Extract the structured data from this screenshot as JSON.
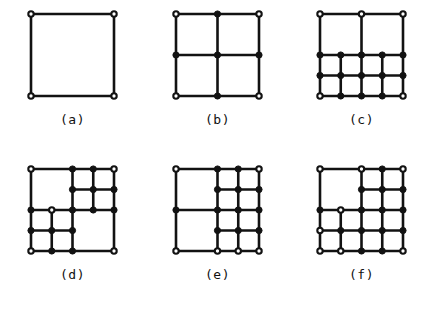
{
  "figure": {
    "title": "",
    "background_color": "#ffffff",
    "line_color": "#121212",
    "node_filled_color": "#121212",
    "node_open_fill": "#ffffff",
    "width": 434,
    "height": 310,
    "columns": 3,
    "rows": 2
  },
  "chart_data": {
    "type": "diagram",
    "node_legend": {
      "open": "coarse / parent grid node",
      "filled": "refined / hanging node"
    },
    "domain": {
      "x0": 0,
      "x1": 1,
      "y0": 0,
      "y1": 1
    },
    "panels": [
      {
        "label": "(a)",
        "index": 0,
        "divisions": 1,
        "cells": 1,
        "node_counts": {
          "open": 4,
          "filled": 0,
          "total": 4
        },
        "segments": [
          [
            0,
            0,
            1,
            0
          ],
          [
            0,
            1,
            1,
            1
          ],
          [
            0,
            0,
            0,
            1
          ],
          [
            1,
            0,
            1,
            1
          ]
        ],
        "nodes_open": [
          [
            0,
            0
          ],
          [
            1,
            0
          ],
          [
            0,
            1
          ],
          [
            1,
            1
          ]
        ],
        "nodes_filled": []
      },
      {
        "label": "(b)",
        "index": 1,
        "divisions": 2,
        "cells": 4,
        "node_counts": {
          "open": 4,
          "filled": 5,
          "total": 9
        },
        "segments": [
          [
            0,
            0,
            1,
            0
          ],
          [
            0,
            0.5,
            1,
            0.5
          ],
          [
            0,
            1,
            1,
            1
          ],
          [
            0,
            0,
            0,
            1
          ],
          [
            0.5,
            0,
            0.5,
            1
          ],
          [
            1,
            0,
            1,
            1
          ]
        ],
        "nodes_open": [
          [
            0,
            0
          ],
          [
            1,
            0
          ],
          [
            0,
            1
          ],
          [
            1,
            1
          ]
        ],
        "nodes_filled": [
          [
            0.5,
            0
          ],
          [
            0,
            0.5
          ],
          [
            0.5,
            0.5
          ],
          [
            1,
            0.5
          ],
          [
            0.5,
            1
          ]
        ]
      },
      {
        "label": "(c)",
        "index": 2,
        "cells": 10,
        "refinement": "bottom half refined to 4 columns x 2 rows; top half left coarse 2 x 1",
        "node_counts": {
          "open": 5,
          "filled": 13,
          "total": 18
        },
        "segments": [
          [
            0,
            1,
            1,
            1
          ],
          [
            0,
            0.5,
            1,
            0.5
          ],
          [
            0,
            0.25,
            1,
            0.25
          ],
          [
            0,
            0,
            1,
            0
          ],
          [
            0,
            0,
            0,
            1
          ],
          [
            0.25,
            0,
            0.25,
            0.5
          ],
          [
            0.5,
            0,
            0.5,
            1
          ],
          [
            0.75,
            0,
            0.75,
            0.5
          ],
          [
            1,
            0,
            1,
            1
          ]
        ],
        "nodes_open": [
          [
            0,
            1
          ],
          [
            0.5,
            1
          ],
          [
            1,
            1
          ],
          [
            0,
            0
          ],
          [
            1,
            0
          ]
        ],
        "nodes_filled": [
          [
            0,
            0.5
          ],
          [
            0.25,
            0.5
          ],
          [
            0.5,
            0.5
          ],
          [
            0.75,
            0.5
          ],
          [
            1,
            0.5
          ],
          [
            0,
            0.25
          ],
          [
            0.25,
            0.25
          ],
          [
            0.5,
            0.25
          ],
          [
            0.75,
            0.25
          ],
          [
            1,
            0.25
          ],
          [
            0.25,
            0
          ],
          [
            0.5,
            0
          ],
          [
            0.75,
            0
          ]
        ]
      },
      {
        "label": "(d)",
        "index": 3,
        "cells": 10,
        "refinement": "top-right and bottom-left quadrants refined to 2 x 2; other two quadrants coarse",
        "node_counts": {
          "open": 5,
          "filled": 13,
          "total": 18
        },
        "segments": [
          [
            0,
            1,
            1,
            1
          ],
          [
            0,
            0.5,
            1,
            0.5
          ],
          [
            0.5,
            0.75,
            1,
            0.75
          ],
          [
            0,
            0.25,
            0.5,
            0.25
          ],
          [
            0,
            0,
            1,
            0
          ],
          [
            0,
            0,
            0,
            1
          ],
          [
            0.25,
            0,
            0.25,
            0.5
          ],
          [
            0.5,
            0,
            0.5,
            1
          ],
          [
            0.75,
            0.5,
            0.75,
            1
          ],
          [
            1,
            0,
            1,
            1
          ]
        ],
        "nodes_open": [
          [
            0,
            1
          ],
          [
            1,
            1
          ],
          [
            0,
            0
          ],
          [
            1,
            0
          ],
          [
            0.25,
            0.5
          ]
        ],
        "nodes_filled": [
          [
            0.5,
            1
          ],
          [
            0.75,
            1
          ],
          [
            0.5,
            0.75
          ],
          [
            0.75,
            0.75
          ],
          [
            1,
            0.75
          ],
          [
            0,
            0.5
          ],
          [
            0.5,
            0.5
          ],
          [
            0.75,
            0.5
          ],
          [
            1,
            0.5
          ],
          [
            0,
            0.25
          ],
          [
            0.25,
            0.25
          ],
          [
            0.5,
            0.25
          ],
          [
            0.25,
            0
          ],
          [
            0.5,
            0
          ]
        ]
      },
      {
        "label": "(e)",
        "index": 4,
        "cells": 10,
        "refinement": "right half refined to 2 columns x 4 rows; left half coarse 1 x 2",
        "node_counts": {
          "open": 6,
          "filled": 12,
          "total": 18
        },
        "segments": [
          [
            0,
            1,
            1,
            1
          ],
          [
            0.5,
            0.75,
            1,
            0.75
          ],
          [
            0,
            0.5,
            1,
            0.5
          ],
          [
            0.5,
            0.25,
            1,
            0.25
          ],
          [
            0,
            0,
            1,
            0
          ],
          [
            0,
            0,
            0,
            1
          ],
          [
            0.5,
            0,
            0.5,
            1
          ],
          [
            0.75,
            0,
            0.75,
            1
          ],
          [
            1,
            0,
            1,
            1
          ]
        ],
        "nodes_open": [
          [
            0,
            1
          ],
          [
            1,
            1
          ],
          [
            0,
            0
          ],
          [
            0.5,
            0
          ],
          [
            0.75,
            0
          ],
          [
            1,
            0
          ]
        ],
        "nodes_filled": [
          [
            0.5,
            1
          ],
          [
            0.75,
            1
          ],
          [
            0.5,
            0.75
          ],
          [
            0.75,
            0.75
          ],
          [
            1,
            0.75
          ],
          [
            0,
            0.5
          ],
          [
            0.5,
            0.5
          ],
          [
            0.75,
            0.5
          ],
          [
            1,
            0.5
          ],
          [
            0.5,
            0.25
          ],
          [
            0.75,
            0.25
          ],
          [
            1,
            0.25
          ]
        ]
      },
      {
        "label": "(f)",
        "index": 5,
        "cells": 12,
        "refinement": "right half refined to 2 columns x 4 rows; bottom-left quadrant refined to 2 x 2; top-left quadrant coarse",
        "node_counts": {
          "open": 8,
          "filled": 13,
          "total": 21
        },
        "segments": [
          [
            0,
            1,
            1,
            1
          ],
          [
            0.5,
            0.75,
            1,
            0.75
          ],
          [
            0,
            0.5,
            1,
            0.5
          ],
          [
            0,
            0.25,
            1,
            0.25
          ],
          [
            0,
            0,
            1,
            0
          ],
          [
            0,
            0,
            0,
            1
          ],
          [
            0.25,
            0,
            0.25,
            0.5
          ],
          [
            0.5,
            0,
            0.5,
            1
          ],
          [
            0.75,
            0,
            0.75,
            1
          ],
          [
            1,
            0,
            1,
            1
          ]
        ],
        "nodes_open": [
          [
            0,
            1
          ],
          [
            1,
            1
          ],
          [
            0,
            0
          ],
          [
            0.25,
            0
          ],
          [
            0.25,
            0.5
          ],
          [
            0,
            0.25
          ],
          [
            0.5,
            1
          ],
          [
            1,
            0
          ]
        ],
        "nodes_filled": [
          [
            0.75,
            1
          ],
          [
            0.5,
            0.75
          ],
          [
            0.75,
            0.75
          ],
          [
            1,
            0.75
          ],
          [
            0,
            0.5
          ],
          [
            0.5,
            0.5
          ],
          [
            0.75,
            0.5
          ],
          [
            1,
            0.5
          ],
          [
            0.25,
            0.25
          ],
          [
            0.5,
            0.25
          ],
          [
            0.75,
            0.25
          ],
          [
            1,
            0.25
          ],
          [
            0.5,
            0
          ],
          [
            0.75,
            0
          ]
        ]
      }
    ]
  }
}
